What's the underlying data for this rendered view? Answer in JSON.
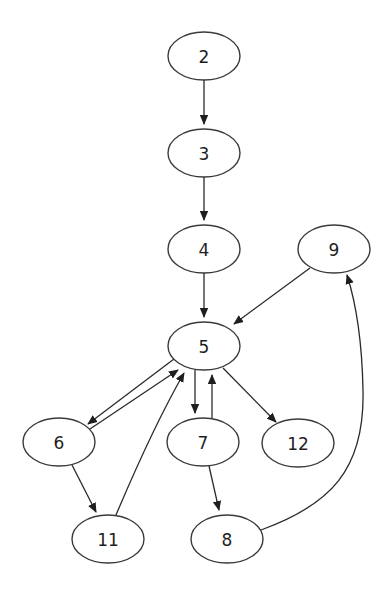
{
  "diagram": {
    "type": "directed-graph",
    "background": "#ffffff",
    "stroke_color": "#3a3a3a",
    "node_shape": "ellipse",
    "node_rx": 36,
    "node_ry": 24,
    "nodes": [
      {
        "id": "2",
        "label": "2",
        "cx": 204,
        "cy": 56
      },
      {
        "id": "3",
        "label": "3",
        "cx": 204,
        "cy": 153
      },
      {
        "id": "4",
        "label": "4",
        "cx": 204,
        "cy": 249
      },
      {
        "id": "9",
        "label": "9",
        "cx": 334,
        "cy": 249
      },
      {
        "id": "5",
        "label": "5",
        "cx": 204,
        "cy": 346
      },
      {
        "id": "6",
        "label": "6",
        "cx": 59,
        "cy": 442
      },
      {
        "id": "7",
        "label": "7",
        "cx": 203,
        "cy": 442
      },
      {
        "id": "12",
        "label": "12",
        "cx": 298,
        "cy": 443
      },
      {
        "id": "11",
        "label": "11",
        "cx": 108,
        "cy": 539
      },
      {
        "id": "8",
        "label": "8",
        "cx": 227,
        "cy": 539
      }
    ],
    "edges": [
      {
        "from": "2",
        "to": "3",
        "path": "M204,80 L204,124"
      },
      {
        "from": "3",
        "to": "4",
        "path": "M204,177 L204,220"
      },
      {
        "from": "4",
        "to": "5",
        "path": "M204,273 L204,317"
      },
      {
        "from": "9",
        "to": "5",
        "path": "M310,268 L234,324"
      },
      {
        "from": "5",
        "to": "6",
        "path": "M174,359 L88,424"
      },
      {
        "from": "6",
        "to": "5",
        "path": "M84,433 L178,370"
      },
      {
        "from": "5",
        "to": "7",
        "path": "M195,370 L195,413"
      },
      {
        "from": "7",
        "to": "5",
        "path": "M212,418 L212,375"
      },
      {
        "from": "5",
        "to": "12",
        "path": "M223,368 L276,422"
      },
      {
        "from": "6",
        "to": "11",
        "path": "M72,465 L96,512"
      },
      {
        "from": "11",
        "to": "5",
        "path": "M116,515 C135,470 160,415 184,373"
      },
      {
        "from": "7",
        "to": "8",
        "path": "M209,466 L219,510"
      },
      {
        "from": "8",
        "to": "9",
        "path": "M261,530 C330,505 365,470 363,390 C362,340 355,300 347,275"
      }
    ]
  }
}
